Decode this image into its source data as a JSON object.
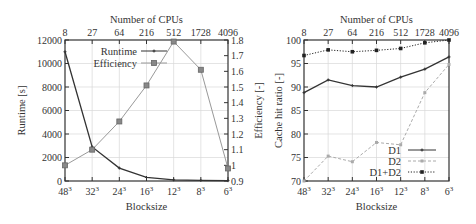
{
  "chart_data": [
    {
      "type": "line",
      "title": "",
      "xlabel": "Blocksize",
      "x2label": "Number of CPUs",
      "ylabel": "Runtime [s]",
      "y2label": "Efficiency [-]",
      "categories": [
        "48³",
        "32³",
        "24³",
        "16³",
        "12³",
        "8³",
        "6³"
      ],
      "top_categories": [
        "8",
        "27",
        "64",
        "216",
        "512",
        "1728",
        "4096"
      ],
      "ylim": [
        0,
        12000
      ],
      "y2lim": [
        0.9,
        1.8
      ],
      "yticks": [
        0,
        2000,
        4000,
        6000,
        8000,
        10000,
        12000
      ],
      "y2ticks": [
        0.9,
        1.0,
        1.1,
        1.2,
        1.3,
        1.4,
        1.5,
        1.6,
        1.7,
        1.8
      ],
      "grid": true,
      "legend_position": "upper center",
      "series": [
        {
          "name": "Runtime",
          "axis": "left",
          "marker": "plus",
          "color": "#333333",
          "values": [
            11000,
            2900,
            1100,
            300,
            100,
            50,
            30
          ]
        },
        {
          "name": "Efficiency",
          "axis": "right",
          "marker": "square",
          "color": "#999999",
          "values": [
            1.0,
            1.1,
            1.28,
            1.51,
            1.79,
            1.61,
            0.98
          ]
        }
      ]
    },
    {
      "type": "line",
      "title": "",
      "xlabel": "Blocksize",
      "x2label": "Number of CPUs",
      "ylabel": "Cache hit ratio [-]",
      "categories": [
        "48³",
        "32³",
        "24³",
        "16³",
        "12³",
        "8³",
        "6³"
      ],
      "top_categories": [
        "8",
        "27",
        "64",
        "216",
        "512",
        "1728",
        "4096"
      ],
      "ylim": [
        70,
        100
      ],
      "yticks": [
        70,
        75,
        80,
        85,
        90,
        95,
        100
      ],
      "grid": true,
      "legend_position": "lower right",
      "series": [
        {
          "name": "D1",
          "style": "solid",
          "marker": "plus",
          "color": "#333333",
          "values": [
            88.8,
            91.5,
            90.3,
            90.0,
            92.1,
            93.8,
            96.4
          ]
        },
        {
          "name": "D2",
          "style": "dashed",
          "marker": "square-small",
          "color": "#aaaaaa",
          "values": [
            70.0,
            75.3,
            74.1,
            78.2,
            77.7,
            88.8,
            94.8
          ]
        },
        {
          "name": "D1+D2",
          "style": "dotted",
          "marker": "square-filled",
          "color": "#222222",
          "values": [
            96.7,
            97.9,
            97.5,
            97.8,
            98.2,
            99.4,
            100.0
          ]
        }
      ]
    }
  ]
}
